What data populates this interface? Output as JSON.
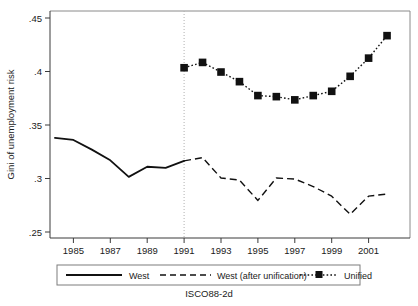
{
  "figure": {
    "note": "ISCO88-2d",
    "background": "#ffffff",
    "ink_color": "#111111",
    "frame_color": "#8a8a8a"
  },
  "chart_data": {
    "type": "line",
    "title": "",
    "subtitle": "",
    "xlabel": "",
    "ylabel": "Gini of unemployment risk",
    "xlim": [
      1983.6,
      2002.8
    ],
    "ylim": [
      0.25,
      0.45
    ],
    "yticks": [
      0.25,
      0.3,
      0.35,
      0.4,
      0.45
    ],
    "ytick_labels": [
      ".25",
      ".3",
      ".35",
      ".4",
      ".45"
    ],
    "xticks": [
      1985,
      1987,
      1989,
      1991,
      1993,
      1995,
      1997,
      1999,
      2001
    ],
    "xtick_labels": [
      "1985",
      "1987",
      "1989",
      "1991",
      "1993",
      "1995",
      "1997",
      "1999",
      "2001"
    ],
    "grid": false,
    "legend_position": "below-axes",
    "annotations": [
      {
        "name": "unification-reference-line",
        "type": "vline",
        "x": 1991,
        "style": "dotted",
        "color": "#b0b0b0"
      }
    ],
    "series": [
      {
        "name": "West",
        "style": "solid",
        "marker": "none",
        "color": "#111111",
        "x": [
          1984,
          1985,
          1986,
          1987,
          1988,
          1989,
          1990,
          1991
        ],
        "values": [
          0.338,
          0.336,
          0.327,
          0.317,
          0.3015,
          0.311,
          0.31,
          0.3165
        ]
      },
      {
        "name": "West (after unification)",
        "style": "dashed",
        "marker": "none",
        "color": "#111111",
        "x": [
          1991,
          1992,
          1993,
          1994,
          1995,
          1996,
          1997,
          1998,
          1999,
          2000,
          2001,
          2002
        ],
        "values": [
          0.3165,
          0.3195,
          0.3005,
          0.2985,
          0.2795,
          0.3005,
          0.2995,
          0.2925,
          0.2835,
          0.2665,
          0.2835,
          0.2855
        ]
      },
      {
        "name": "Unified",
        "style": "dotted",
        "marker": "filled-square",
        "color": "#111111",
        "x": [
          1991,
          1992,
          1993,
          1994,
          1995,
          1996,
          1997,
          1998,
          1999,
          2000,
          2001,
          2002
        ],
        "values": [
          0.4035,
          0.4085,
          0.3995,
          0.3905,
          0.3775,
          0.3765,
          0.3735,
          0.3775,
          0.3815,
          0.3955,
          0.4125,
          0.4335
        ]
      }
    ]
  },
  "legend": {
    "entries": [
      {
        "label": "West",
        "style": "solid",
        "marker": "none"
      },
      {
        "label": "West (after unification)",
        "style": "dashed",
        "marker": "none"
      },
      {
        "label": "Unified",
        "style": "dotted",
        "marker": "filled-square"
      }
    ]
  }
}
